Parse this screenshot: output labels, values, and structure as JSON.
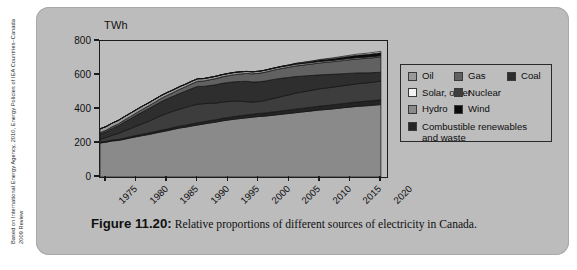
{
  "credit": {
    "text": "Based on International Energy Agency, 2010, Energy Policies of IEA Countries–Canada 2009 Review"
  },
  "caption": {
    "figure_number": "Figure 11.20:",
    "text": "Relative proportions of different sources of electricity in Canada."
  },
  "axes": {
    "y_unit_label": "TWh",
    "y_ticks": [
      "0",
      "200",
      "400",
      "600",
      "800"
    ],
    "x_ticks": [
      "1975",
      "1980",
      "1985",
      "1990",
      "1995",
      "2000",
      "2005",
      "2010",
      "2015",
      "2020"
    ]
  },
  "legend": {
    "rows": [
      [
        {
          "label": "Oil",
          "color": "#9a9a9a",
          "icon": "legend-swatch-oil"
        },
        {
          "label": "Gas",
          "color": "#616161",
          "icon": "legend-swatch-gas"
        },
        {
          "label": "Coal",
          "color": "#2e2e2e",
          "icon": "legend-swatch-coal"
        }
      ],
      [
        {
          "label": "Solar, other",
          "color": "#f2f2f2",
          "icon": "legend-swatch-solar-other"
        },
        {
          "label": "Nuclear",
          "color": "#3d3d3d",
          "icon": "legend-swatch-nuclear"
        }
      ],
      [
        {
          "label": "Hydro",
          "color": "#8a8a8a",
          "icon": "legend-swatch-hydro"
        },
        {
          "label": "Wind",
          "color": "#0b0b0b",
          "icon": "legend-swatch-wind"
        }
      ]
    ],
    "wide_row": {
      "label": "Combustible renewables and waste",
      "color": "#242424",
      "icon": "legend-swatch-combustible-renewables"
    }
  },
  "chart_data": {
    "type": "area",
    "title": "Relative proportions of different sources of electricity in Canada",
    "xlabel": "",
    "ylabel": "TWh",
    "ylim": [
      0,
      800
    ],
    "xlim": [
      1974,
      2021
    ],
    "grid": false,
    "legend_position": "right",
    "stacked": true,
    "x": [
      1974,
      1975,
      1976,
      1977,
      1978,
      1979,
      1980,
      1981,
      1982,
      1983,
      1984,
      1985,
      1986,
      1987,
      1988,
      1989,
      1990,
      1991,
      1992,
      1993,
      1994,
      1995,
      1996,
      1997,
      1998,
      1999,
      2000,
      2001,
      2002,
      2003,
      2004,
      2005,
      2006,
      2007,
      2008,
      2009,
      2010,
      2012,
      2014,
      2016,
      2018,
      2020
    ],
    "series": [
      {
        "name": "Hydro",
        "color": "#8a8a8a",
        "values": [
          200,
          205,
          212,
          215,
          222,
          230,
          237,
          244,
          250,
          258,
          265,
          272,
          280,
          288,
          293,
          300,
          306,
          312,
          318,
          323,
          330,
          335,
          340,
          344,
          348,
          352,
          356,
          358,
          362,
          366,
          370,
          374,
          378,
          382,
          386,
          390,
          394,
          400,
          408,
          415,
          420,
          426
        ]
      },
      {
        "name": "Combustible renewables and waste",
        "color": "#242424",
        "values": [
          5,
          5,
          6,
          6,
          7,
          7,
          8,
          8,
          9,
          9,
          10,
          10,
          11,
          11,
          12,
          12,
          13,
          13,
          14,
          14,
          15,
          15,
          16,
          16,
          17,
          17,
          18,
          18,
          19,
          19,
          20,
          20,
          21,
          21,
          22,
          22,
          23,
          24,
          25,
          26,
          27,
          28
        ]
      },
      {
        "name": "Nuclear",
        "color": "#3d3d3d",
        "values": [
          18,
          22,
          28,
          34,
          42,
          48,
          55,
          62,
          70,
          78,
          86,
          92,
          96,
          100,
          104,
          108,
          110,
          106,
          102,
          98,
          96,
          94,
          90,
          86,
          78,
          72,
          70,
          74,
          78,
          82,
          86,
          90,
          94,
          96,
          98,
          100,
          102,
          104,
          105,
          107,
          108,
          110
        ]
      },
      {
        "name": "Coal",
        "color": "#2e2e2e",
        "values": [
          30,
          34,
          40,
          46,
          52,
          58,
          64,
          70,
          74,
          78,
          82,
          86,
          88,
          92,
          96,
          100,
          104,
          102,
          104,
          108,
          110,
          112,
          114,
          116,
          120,
          118,
          116,
          114,
          112,
          110,
          106,
          102,
          98,
          94,
          90,
          86,
          82,
          76,
          70,
          64,
          58,
          52
        ]
      },
      {
        "name": "Gas",
        "color": "#616161",
        "values": [
          8,
          9,
          10,
          11,
          12,
          13,
          14,
          15,
          16,
          17,
          19,
          20,
          22,
          24,
          26,
          28,
          30,
          32,
          34,
          36,
          38,
          40,
          42,
          44,
          46,
          48,
          50,
          52,
          54,
          56,
          58,
          60,
          62,
          64,
          66,
          68,
          70,
          74,
          78,
          82,
          86,
          90
        ]
      },
      {
        "name": "Oil",
        "color": "#9a9a9a",
        "values": [
          22,
          22,
          21,
          21,
          20,
          20,
          19,
          19,
          18,
          18,
          17,
          17,
          16,
          16,
          15,
          15,
          15,
          14,
          14,
          14,
          13,
          13,
          13,
          13,
          12,
          12,
          12,
          12,
          11,
          11,
          11,
          10,
          10,
          10,
          9,
          9,
          9,
          8,
          8,
          8,
          7,
          7
        ]
      },
      {
        "name": "Wind",
        "color": "#0b0b0b",
        "values": [
          0,
          0,
          0,
          0,
          0,
          0,
          0,
          0,
          0,
          0,
          0,
          0,
          0,
          0,
          0,
          0,
          0,
          0,
          0,
          0,
          0,
          0,
          0,
          0,
          0,
          0,
          0,
          0,
          1,
          1,
          2,
          3,
          4,
          5,
          6,
          7,
          8,
          10,
          12,
          14,
          16,
          18
        ]
      },
      {
        "name": "Solar, other",
        "color": "#f2f2f2",
        "values": [
          0,
          0,
          0,
          0,
          0,
          0,
          0,
          0,
          0,
          0,
          0,
          0,
          0,
          0,
          0,
          0,
          0,
          0,
          0,
          0,
          0,
          0,
          0,
          0,
          0,
          0,
          0,
          0,
          0,
          0,
          0,
          0,
          1,
          1,
          2,
          2,
          3,
          4,
          5,
          6,
          7,
          8
        ]
      }
    ]
  }
}
